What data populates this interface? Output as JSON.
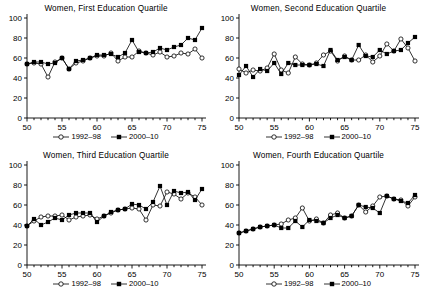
{
  "figure": {
    "panel_count": 4,
    "legend": [
      {
        "key": "series1",
        "label": "1992–98",
        "marker": "open-circle-marker",
        "color": "#000000"
      },
      {
        "key": "series2",
        "label": "2000–10",
        "marker": "filled-square-marker",
        "color": "#000000"
      }
    ]
  },
  "chart_data": [
    {
      "type": "line",
      "title": "Women, First Education Quartile",
      "xlabel": "",
      "ylabel": "",
      "xlim": [
        50,
        75
      ],
      "ylim": [
        0,
        100
      ],
      "xticks": [
        50,
        55,
        60,
        65,
        70,
        75
      ],
      "yticks": [
        0,
        20,
        40,
        60,
        80,
        100
      ],
      "xtick_minor_step": 1,
      "grid": false,
      "legend_position": "bottom-center",
      "x": [
        50,
        51,
        52,
        53,
        54,
        55,
        56,
        57,
        58,
        59,
        60,
        61,
        62,
        63,
        64,
        65,
        66,
        67,
        68,
        69,
        70,
        71,
        72,
        73,
        74,
        75
      ],
      "series": [
        {
          "name": "1992–98",
          "marker": "open-circle-marker",
          "values": [
            54,
            55,
            54,
            41,
            56,
            60,
            49,
            55,
            57,
            60,
            62,
            62,
            65,
            57,
            61,
            61,
            67,
            65,
            63,
            66,
            61,
            62,
            65,
            64,
            69,
            60
          ]
        },
        {
          "name": "2000–10",
          "marker": "filled-square-marker",
          "values": [
            54,
            56,
            56,
            54,
            55,
            60,
            49,
            57,
            58,
            60,
            63,
            63,
            64,
            61,
            65,
            78,
            66,
            65,
            66,
            70,
            68,
            71,
            73,
            80,
            78,
            90
          ]
        }
      ]
    },
    {
      "type": "line",
      "title": "Women, Second Education Quartile",
      "xlabel": "",
      "ylabel": "",
      "xlim": [
        50,
        75
      ],
      "ylim": [
        0,
        100
      ],
      "xticks": [
        50,
        55,
        60,
        65,
        70,
        75
      ],
      "yticks": [
        0,
        20,
        40,
        60,
        80,
        100
      ],
      "xtick_minor_step": 1,
      "grid": false,
      "legend_position": "bottom-center",
      "x": [
        50,
        51,
        52,
        53,
        54,
        55,
        56,
        57,
        58,
        59,
        60,
        61,
        62,
        63,
        64,
        65,
        66,
        67,
        68,
        69,
        70,
        71,
        72,
        73,
        74,
        75
      ],
      "series": [
        {
          "name": "1992–98",
          "marker": "open-circle-marker",
          "values": [
            49,
            45,
            48,
            47,
            50,
            64,
            48,
            45,
            61,
            54,
            53,
            55,
            63,
            67,
            57,
            62,
            58,
            58,
            63,
            56,
            62,
            74,
            67,
            79,
            70,
            57
          ]
        },
        {
          "name": "2000–10",
          "marker": "filled-square-marker",
          "values": [
            43,
            52,
            41,
            49,
            47,
            55,
            44,
            55,
            53,
            53,
            53,
            54,
            52,
            68,
            58,
            61,
            58,
            73,
            62,
            61,
            68,
            64,
            67,
            68,
            75,
            81
          ]
        }
      ]
    },
    {
      "type": "line",
      "title": "Women, Third Education Quartile",
      "xlabel": "",
      "ylabel": "",
      "xlim": [
        50,
        75
      ],
      "ylim": [
        0,
        100
      ],
      "xticks": [
        50,
        55,
        60,
        65,
        70,
        75
      ],
      "yticks": [
        0,
        20,
        40,
        60,
        80,
        100
      ],
      "xtick_minor_step": 1,
      "grid": false,
      "legend_position": "bottom-center",
      "x": [
        50,
        51,
        52,
        53,
        54,
        55,
        56,
        57,
        58,
        59,
        60,
        61,
        62,
        63,
        64,
        65,
        66,
        67,
        68,
        69,
        70,
        71,
        72,
        73,
        74,
        75
      ],
      "series": [
        {
          "name": "1992–98",
          "marker": "open-circle-marker",
          "values": [
            39,
            44,
            48,
            49,
            49,
            50,
            45,
            48,
            49,
            50,
            46,
            49,
            52,
            55,
            56,
            57,
            56,
            45,
            60,
            59,
            73,
            71,
            66,
            72,
            68,
            60
          ]
        },
        {
          "name": "2000–10",
          "marker": "filled-square-marker",
          "values": [
            39,
            46,
            40,
            43,
            47,
            45,
            50,
            52,
            52,
            52,
            43,
            49,
            53,
            55,
            56,
            61,
            60,
            56,
            63,
            79,
            60,
            74,
            72,
            73,
            65,
            76
          ]
        }
      ]
    },
    {
      "type": "line",
      "title": "Women, Fourth Education Quartile",
      "xlabel": "",
      "ylabel": "",
      "xlim": [
        50,
        75
      ],
      "ylim": [
        0,
        100
      ],
      "xticks": [
        50,
        55,
        60,
        65,
        70,
        75
      ],
      "yticks": [
        0,
        20,
        40,
        60,
        80,
        100
      ],
      "xtick_minor_step": 1,
      "grid": false,
      "legend_position": "bottom-center",
      "x": [
        50,
        51,
        52,
        53,
        54,
        55,
        56,
        57,
        58,
        59,
        60,
        61,
        62,
        63,
        64,
        65,
        66,
        67,
        68,
        69,
        70,
        71,
        72,
        73,
        74,
        75
      ],
      "series": [
        {
          "name": "1992–98",
          "marker": "open-circle-marker",
          "values": [
            32,
            34,
            36,
            38,
            39,
            40,
            41,
            45,
            47,
            57,
            44,
            46,
            42,
            50,
            52,
            47,
            49,
            60,
            53,
            59,
            68,
            69,
            66,
            65,
            59,
            68
          ]
        },
        {
          "name": "2000–10",
          "marker": "filled-square-marker",
          "values": [
            32,
            34,
            36,
            38,
            39,
            40,
            37,
            37,
            44,
            38,
            45,
            44,
            42,
            47,
            50,
            47,
            49,
            60,
            58,
            57,
            52,
            69,
            66,
            64,
            62,
            70
          ]
        }
      ]
    }
  ]
}
